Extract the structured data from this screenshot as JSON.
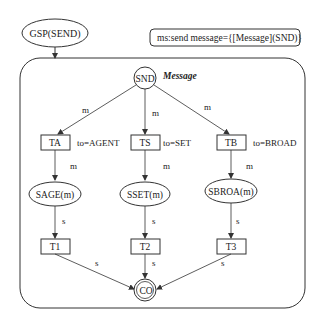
{
  "title_node": {
    "label": "GSP(SEND)"
  },
  "annotation": {
    "label": "ms:send message={[Message](SND)}"
  },
  "container": {
    "label": "Message"
  },
  "start": {
    "label": "SND"
  },
  "end": {
    "label": "CO"
  },
  "branches": [
    {
      "transition": "TA",
      "guard": "to=AGENT",
      "place": "SAGE(m)",
      "final": "T1"
    },
    {
      "transition": "TS",
      "guard": "to=SET",
      "place": "SSET(m)",
      "final": "T2"
    },
    {
      "transition": "TB",
      "guard": "to=BROAD",
      "place": "SBROA(m)",
      "final": "T3"
    }
  ],
  "arc_labels": {
    "m": "m",
    "s": "s"
  }
}
